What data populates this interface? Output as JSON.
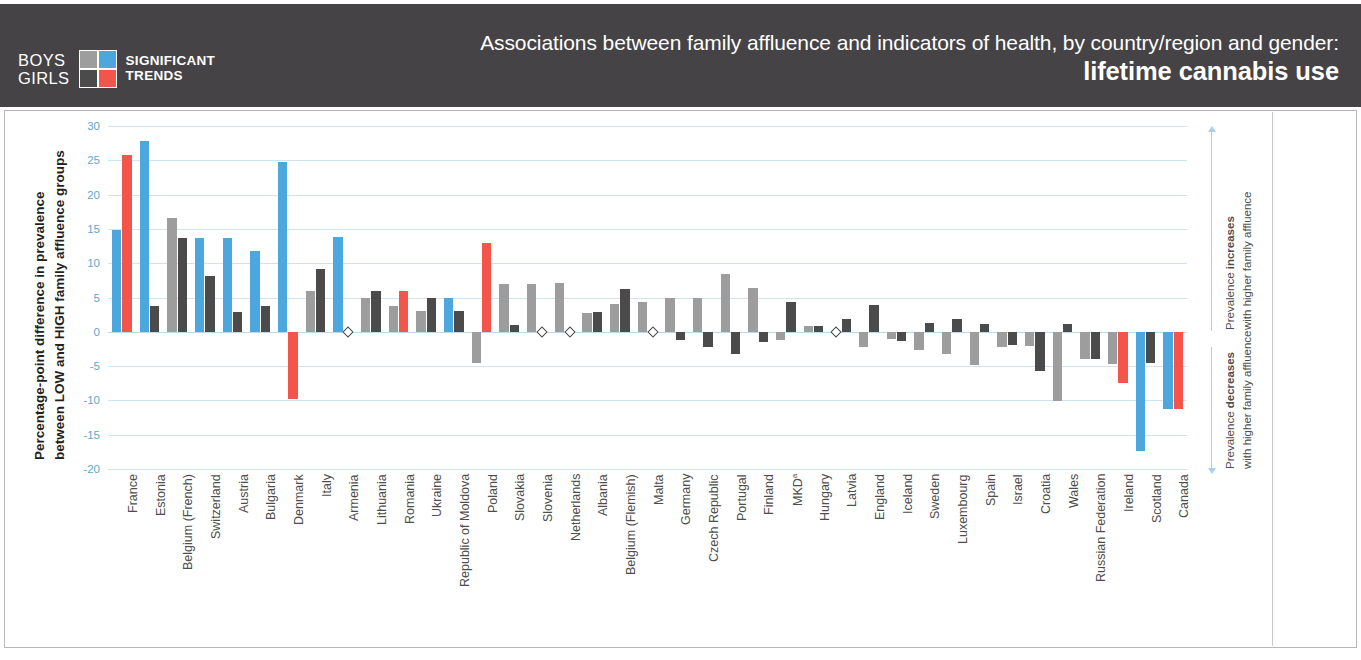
{
  "header": {
    "gender_top": "BOYS",
    "gender_bottom": "GIRLS",
    "legend_line1": "SIGNIFICANT",
    "legend_line2": "TRENDS",
    "title_line1": "Associations between family affluence and indicators of health, by country/region and gender:",
    "title_line2": "lifetime cannabis use"
  },
  "colors": {
    "boys_significant": "#4ba7dd",
    "boys_nonsignificant": "#9d9d9d",
    "girls_significant": "#f4554a",
    "girls_nonsignificant": "#4b4b4b",
    "header_band": "#454345",
    "gridline": "#cfe4f0",
    "axis_text": "#5aa8d4"
  },
  "axis": {
    "y_title_line1": "Percentage-point difference in prevalence",
    "y_title_line2": "between LOW and HIGH family affluence groups",
    "y_ticks": [
      "30",
      "25",
      "20",
      "15",
      "10",
      "5",
      "0",
      "-5",
      "-10",
      "-15",
      "-20"
    ]
  },
  "annotations": {
    "increase_bold": "Prevalence increases",
    "increase_rest": "with higher family affluence",
    "decrease_bold": "Prevalence decreases",
    "decrease_rest": "with higher family affluence"
  },
  "chart_data": {
    "type": "bar",
    "title": "Associations between family affluence and indicators of health, by country/region and gender: lifetime cannabis use",
    "xlabel": "",
    "ylabel": "Percentage-point difference in prevalence between LOW and HIGH family affluence groups",
    "ylim": [
      -20,
      30
    ],
    "ytick_values": [
      30,
      25,
      20,
      15,
      10,
      5,
      0,
      -5,
      -10,
      -15,
      -20
    ],
    "grid": true,
    "legend_position": "header",
    "series": [
      {
        "name": "Boys",
        "significant_color": "#4ba7dd",
        "nonsignificant_color": "#9d9d9d"
      },
      {
        "name": "Girls",
        "significant_color": "#f4554a",
        "nonsignificant_color": "#4b4b4b"
      }
    ],
    "categories": [
      "France",
      "Estonia",
      "Belgium (French)",
      "Switzerland",
      "Austria",
      "Bulgaria",
      "Denmark",
      "Italy",
      "Armenia",
      "Lithuania",
      "Romania",
      "Ukraine",
      "Republic of Moldova",
      "Poland",
      "Slovakia",
      "Slovenia",
      "Netherlands",
      "Albania",
      "Belgium (Flemish)",
      "Malta",
      "Germany",
      "Czech Republic",
      "Portugal",
      "Finland",
      "MKD",
      "Hungary",
      "Latvia",
      "England",
      "Iceland",
      "Sweden",
      "Luxembourg",
      "Spain",
      "Israel",
      "Croatia",
      "Wales",
      "Russian Federation",
      "Ireland",
      "Scotland",
      "Canada"
    ],
    "points": [
      {
        "country": "France",
        "boys": 14.8,
        "boys_sig": true,
        "girls": 25.7,
        "girls_sig": true
      },
      {
        "country": "Estonia",
        "boys": 27.8,
        "boys_sig": true,
        "girls": 3.7,
        "girls_sig": false
      },
      {
        "country": "Belgium (French)",
        "boys": 16.6,
        "boys_sig": false,
        "girls": 13.7,
        "girls_sig": false
      },
      {
        "country": "Switzerland",
        "boys": 13.7,
        "boys_sig": true,
        "girls": 8.1,
        "girls_sig": false
      },
      {
        "country": "Austria",
        "boys": 13.7,
        "boys_sig": true,
        "girls": 2.9,
        "girls_sig": false
      },
      {
        "country": "Bulgaria",
        "boys": 11.8,
        "boys_sig": true,
        "girls": 3.8,
        "girls_sig": false
      },
      {
        "country": "Denmark",
        "boys": 24.8,
        "boys_sig": true,
        "girls": -9.8,
        "girls_sig": true
      },
      {
        "country": "Italy",
        "boys": 6.0,
        "boys_sig": false,
        "girls": 9.1,
        "girls_sig": false
      },
      {
        "country": "Armenia",
        "boys": 13.8,
        "boys_sig": true,
        "girls": null,
        "girls_sig": false
      },
      {
        "country": "Lithuania",
        "boys": 5.0,
        "boys_sig": false,
        "girls": 6.0,
        "girls_sig": false
      },
      {
        "country": "Romania",
        "boys": 3.8,
        "boys_sig": false,
        "girls": 6.0,
        "girls_sig": true
      },
      {
        "country": "Ukraine",
        "boys": 3.0,
        "boys_sig": false,
        "girls": 5.0,
        "girls_sig": false
      },
      {
        "country": "Republic of Moldova",
        "boys": 4.9,
        "boys_sig": true,
        "girls": 3.0,
        "girls_sig": false
      },
      {
        "country": "Poland",
        "boys": -4.5,
        "boys_sig": false,
        "girls": 12.9,
        "girls_sig": true
      },
      {
        "country": "Slovakia",
        "boys": 7.0,
        "boys_sig": false,
        "girls": 1.0,
        "girls_sig": false
      },
      {
        "country": "Slovenia",
        "boys": 6.9,
        "boys_sig": false,
        "girls": null,
        "girls_sig": false
      },
      {
        "country": "Netherlands",
        "boys": 7.1,
        "boys_sig": false,
        "girls": null,
        "girls_sig": false
      },
      {
        "country": "Albania",
        "boys": 2.8,
        "boys_sig": false,
        "girls": 2.9,
        "girls_sig": false
      },
      {
        "country": "Belgium (Flemish)",
        "boys": 4.0,
        "boys_sig": false,
        "girls": 6.2,
        "girls_sig": false
      },
      {
        "country": "Malta",
        "boys": 4.4,
        "boys_sig": false,
        "girls": null,
        "girls_sig": false
      },
      {
        "country": "Germany",
        "boys": 5.0,
        "boys_sig": false,
        "girls": -1.2,
        "girls_sig": false
      },
      {
        "country": "Czech Republic",
        "boys": 5.0,
        "boys_sig": false,
        "girls": -2.2,
        "girls_sig": false
      },
      {
        "country": "Portugal",
        "boys": 8.4,
        "boys_sig": false,
        "girls": -3.2,
        "girls_sig": false
      },
      {
        "country": "Finland",
        "boys": 6.4,
        "boys_sig": false,
        "girls": -1.5,
        "girls_sig": false
      },
      {
        "country": "MKD",
        "boys": -1.2,
        "boys_sig": false,
        "girls": 4.3,
        "girls_sig": false
      },
      {
        "country": "Hungary",
        "boys": 0.9,
        "boys_sig": false,
        "girls": 0.9,
        "girls_sig": false
      },
      {
        "country": "Latvia",
        "boys": null,
        "boys_sig": false,
        "girls": 1.8,
        "girls_sig": false
      },
      {
        "country": "England",
        "boys": -2.2,
        "boys_sig": false,
        "girls": 3.9,
        "girls_sig": false
      },
      {
        "country": "Iceland",
        "boys": -1.0,
        "boys_sig": false,
        "girls": -1.4,
        "girls_sig": false
      },
      {
        "country": "Sweden",
        "boys": -2.6,
        "boys_sig": false,
        "girls": 1.3,
        "girls_sig": false
      },
      {
        "country": "Luxembourg",
        "boys": -3.3,
        "boys_sig": false,
        "girls": 1.9,
        "girls_sig": false
      },
      {
        "country": "Spain",
        "boys": -4.8,
        "boys_sig": false,
        "girls": 1.1,
        "girls_sig": false
      },
      {
        "country": "Israel",
        "boys": -2.2,
        "boys_sig": false,
        "girls": -1.9,
        "girls_sig": false
      },
      {
        "country": "Croatia",
        "boys": -2.0,
        "boys_sig": false,
        "girls": -5.7,
        "girls_sig": false
      },
      {
        "country": "Wales",
        "boys": -10.1,
        "boys_sig": false,
        "girls": 1.1,
        "girls_sig": false
      },
      {
        "country": "Russian Federation",
        "boys": -3.9,
        "boys_sig": false,
        "girls": -4.0,
        "girls_sig": false
      },
      {
        "country": "Ireland",
        "boys": -4.7,
        "boys_sig": false,
        "girls": -7.5,
        "girls_sig": true
      },
      {
        "country": "Scotland",
        "boys": -17.4,
        "boys_sig": true,
        "girls": -4.5,
        "girls_sig": false
      },
      {
        "country": "Canada",
        "boys": -11.2,
        "boys_sig": true,
        "girls": -11.2,
        "girls_sig": true
      }
    ]
  }
}
